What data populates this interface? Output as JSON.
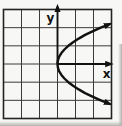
{
  "figure": {
    "description": "Square grid with x and y coordinate axes and a parabola opening to the right"
  },
  "colors": {
    "background": "#f7f7f5",
    "grid_line": "#3a3a38",
    "border": "#232321",
    "axis": "#121210",
    "curve": "#121210",
    "label": "#121210",
    "scan_edge": "#b3b3af"
  },
  "chart_data": {
    "type": "line",
    "title": "",
    "x_range": [
      -3,
      3
    ],
    "y_range": [
      -3,
      3
    ],
    "grid": true,
    "grid_step": 1,
    "axes": {
      "x_label": "x",
      "y_label": "y",
      "arrows": true,
      "origin": [
        0,
        0
      ]
    },
    "series": [
      {
        "name": "parabola",
        "opens": "right",
        "vertex": [
          0,
          0
        ],
        "equation_form": "x = 0.6*y^2",
        "points": [
          [
            2.904,
            -2.2
          ],
          [
            2.4,
            -2.0
          ],
          [
            1.944,
            -1.8
          ],
          [
            1.536,
            -1.6
          ],
          [
            1.176,
            -1.4
          ],
          [
            0.864,
            -1.2
          ],
          [
            0.6,
            -1.0
          ],
          [
            0.384,
            -0.8
          ],
          [
            0.216,
            -0.6
          ],
          [
            0.096,
            -0.4
          ],
          [
            0.024,
            -0.2
          ],
          [
            0,
            0
          ],
          [
            0.024,
            0.2
          ],
          [
            0.096,
            0.4
          ],
          [
            0.216,
            0.6
          ],
          [
            0.384,
            0.8
          ],
          [
            0.6,
            1.0
          ],
          [
            0.864,
            1.2
          ],
          [
            1.176,
            1.4
          ],
          [
            1.536,
            1.6
          ],
          [
            1.944,
            1.8
          ],
          [
            2.4,
            2.0
          ],
          [
            2.904,
            2.2
          ]
        ]
      }
    ]
  }
}
